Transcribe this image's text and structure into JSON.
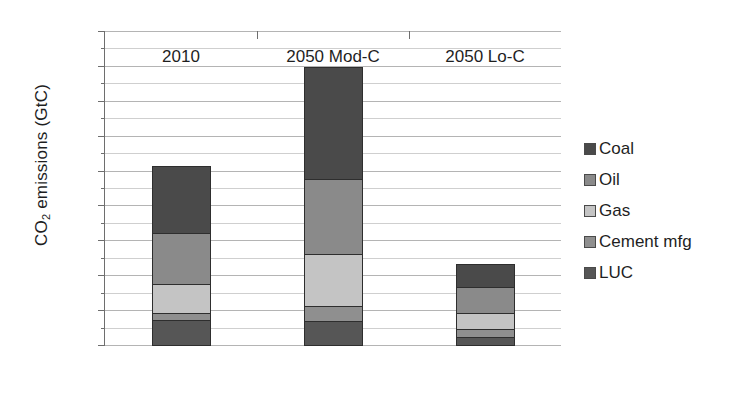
{
  "chart_data": {
    "type": "bar",
    "stacked": true,
    "title": "",
    "subtitle": "",
    "xlabel": "",
    "ylabel": "CO2 emissions  (GtC)",
    "ylabel_html": "CO₂ emissions  (GtC)",
    "categories": [
      "2010",
      "2050 Mod-C",
      "2050 Lo-C"
    ],
    "ylim": [
      0,
      18
    ],
    "ytick_step": 2,
    "yticks": [
      0,
      2,
      4,
      6,
      8,
      10,
      12,
      14,
      16,
      18
    ],
    "minor_gridline_step": 1,
    "grid": true,
    "grid_axis": "y",
    "legend_position": "right",
    "stack_order_bottom_to_top": [
      "LUC",
      "Cement mfg",
      "Gas",
      "Oil",
      "Coal"
    ],
    "series": [
      {
        "name": "Coal",
        "color": "#4a4a4a",
        "values": [
          3.9,
          6.5,
          1.4
        ]
      },
      {
        "name": "Oil",
        "color": "#8a8a8a",
        "values": [
          3.0,
          4.4,
          1.55
        ]
      },
      {
        "name": "Gas",
        "color": "#c4c4c4",
        "values": [
          1.7,
          3.05,
          1.0
        ]
      },
      {
        "name": "Cement mfg",
        "color": "#8f8f8f",
        "values": [
          0.5,
          0.9,
          0.5
        ]
      },
      {
        "name": "LUC",
        "color": "#565656",
        "values": [
          1.5,
          1.45,
          0.55
        ]
      }
    ],
    "totals": [
      10.6,
      16.3,
      5.0
    ]
  },
  "legend": {
    "items": [
      {
        "label": "Coal",
        "color": "#4a4a4a"
      },
      {
        "label": "Oil",
        "color": "#8a8a8a"
      },
      {
        "label": "Gas",
        "color": "#c4c4c4"
      },
      {
        "label": "Cement mfg",
        "color": "#8f8f8f"
      },
      {
        "label": "LUC",
        "color": "#565656"
      }
    ]
  },
  "axes": {
    "y_title_main": "CO",
    "y_title_sub": "2",
    "y_title_rest": " emissions  (GtC)"
  }
}
